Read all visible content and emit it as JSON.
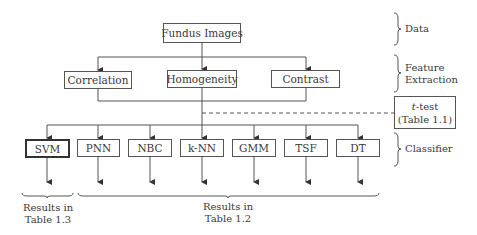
{
  "data_layer": {
    "root": "Fundus Images"
  },
  "features": [
    "Correlation",
    "Homogeneity",
    "Contrast"
  ],
  "selection": {
    "test_name": "t",
    "test_suffix": "-test",
    "test_ref": "(Table 1.1)"
  },
  "classifiers": [
    "SVM",
    "PNN",
    "NBC",
    "k-NN",
    "GMM",
    "TSF",
    "DT"
  ],
  "stage_labels": {
    "data": "Data",
    "feature_line1": "Feature",
    "feature_line2": "Extraction",
    "classifier": "Classifier"
  },
  "results": {
    "svm_line1": "Results in",
    "svm_line2": "Table 1.3",
    "others_line1": "Results in",
    "others_line2": "Table 1.2"
  },
  "colors": {
    "line": "#555555",
    "text": "#3a3a3a"
  }
}
